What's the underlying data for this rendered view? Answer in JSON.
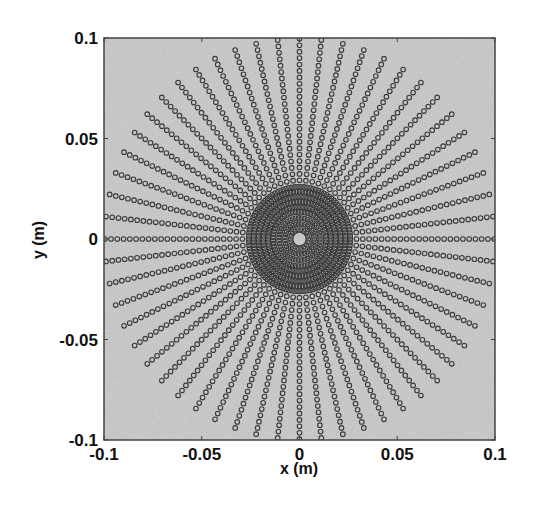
{
  "chart_data": {
    "type": "scatter",
    "title": "",
    "xlabel": "x (m)",
    "ylabel": "y (m)",
    "xlim": [
      -0.1,
      0.1
    ],
    "ylim": [
      -0.1,
      0.1
    ],
    "grid": false,
    "legend": null,
    "x_ticks": [
      -0.1,
      -0.05,
      0,
      0.05,
      0.1
    ],
    "x_tick_labels": [
      "-0.1",
      "-0.05",
      "0",
      "0.05",
      "0.1"
    ],
    "y_ticks": [
      -0.1,
      -0.05,
      0,
      0.05,
      0.1
    ],
    "y_tick_labels": [
      "-0.1",
      "-0.05",
      "0",
      "0.05",
      "0.1"
    ],
    "series": [
      {
        "name": "sample points",
        "marker": "open-circle",
        "color": "#3a3a3a",
        "layout": "polar-grid",
        "center": [
          0,
          0
        ],
        "num_spokes": 56,
        "ring_spacing": 0.0032,
        "num_rings": 31,
        "max_radius": 0.1,
        "dense_inner_rings": [
          0.0045,
          0.0075,
          0.0105,
          0.0135,
          0.016,
          0.0185,
          0.021,
          0.0235,
          0.026
        ]
      }
    ]
  },
  "style": {
    "plot_background": "#c9c9c9",
    "frame_color": "#444444",
    "marker_color": "#3a3a3a"
  }
}
